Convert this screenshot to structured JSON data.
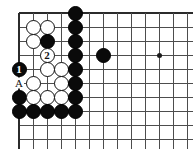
{
  "diagram": {
    "type": "go-board-problem",
    "geometry": {
      "origin_x": 19,
      "origin_y": 13,
      "step": 14,
      "cols": 13,
      "rows": 10
    },
    "edges": {
      "top": true,
      "left": true,
      "right": false,
      "bottom": false
    },
    "hoshi": [
      {
        "col": 10,
        "row": 3,
        "name": "star-point"
      }
    ],
    "stones": [
      {
        "col": 4,
        "row": 0,
        "color": "black",
        "label": ""
      },
      {
        "col": 1,
        "row": 1,
        "color": "white",
        "label": ""
      },
      {
        "col": 2,
        "row": 1,
        "color": "white",
        "label": ""
      },
      {
        "col": 4,
        "row": 1,
        "color": "black",
        "label": ""
      },
      {
        "col": 1,
        "row": 2,
        "color": "white",
        "label": ""
      },
      {
        "col": 2,
        "row": 2,
        "color": "black",
        "label": ""
      },
      {
        "col": 4,
        "row": 2,
        "color": "black",
        "label": ""
      },
      {
        "col": 2,
        "row": 3,
        "color": "white",
        "label": "2"
      },
      {
        "col": 4,
        "row": 3,
        "color": "black",
        "label": ""
      },
      {
        "col": 6,
        "row": 3,
        "color": "black",
        "label": ""
      },
      {
        "col": 0,
        "row": 4,
        "color": "black",
        "label": "1"
      },
      {
        "col": 2,
        "row": 4,
        "color": "white",
        "label": ""
      },
      {
        "col": 3,
        "row": 4,
        "color": "white",
        "label": ""
      },
      {
        "col": 4,
        "row": 4,
        "color": "black",
        "label": ""
      },
      {
        "col": 1,
        "row": 5,
        "color": "white",
        "label": ""
      },
      {
        "col": 3,
        "row": 5,
        "color": "white",
        "label": ""
      },
      {
        "col": 4,
        "row": 5,
        "color": "black",
        "label": ""
      },
      {
        "col": 0,
        "row": 6,
        "color": "black",
        "label": ""
      },
      {
        "col": 1,
        "row": 6,
        "color": "white",
        "label": ""
      },
      {
        "col": 2,
        "row": 6,
        "color": "white",
        "label": ""
      },
      {
        "col": 3,
        "row": 6,
        "color": "white",
        "label": ""
      },
      {
        "col": 4,
        "row": 6,
        "color": "black",
        "label": ""
      },
      {
        "col": 0,
        "row": 7,
        "color": "black",
        "label": ""
      },
      {
        "col": 1,
        "row": 7,
        "color": "black",
        "label": ""
      },
      {
        "col": 2,
        "row": 7,
        "color": "black",
        "label": ""
      },
      {
        "col": 3,
        "row": 7,
        "color": "black",
        "label": ""
      },
      {
        "col": 4,
        "row": 7,
        "color": "black",
        "label": ""
      }
    ],
    "point_labels": [
      {
        "col": 0,
        "row": 5,
        "text": "A",
        "name": "point-label-a"
      }
    ],
    "move_numbers": [
      {
        "text": "1",
        "color": "black",
        "col": 0,
        "row": 4
      },
      {
        "text": "2",
        "color": "white",
        "col": 2,
        "row": 3
      }
    ],
    "colors": {
      "black_stone": "#0a0a0a",
      "white_stone": "#ffffff",
      "grid_line": "#4d4d4d",
      "edge_line": "#2b2b2b",
      "background": "#ffffff",
      "label_text": "#111111"
    }
  }
}
